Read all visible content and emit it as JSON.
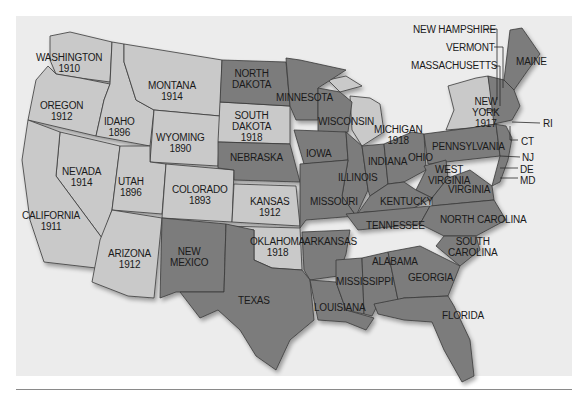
{
  "map": {
    "title": "",
    "colors": {
      "background": "#ececec",
      "suffrage_state": "#c9c9c9",
      "non_suffrage_state": "#7b7b7b",
      "border": "#3a3a3a",
      "text": "#1a1a1a"
    },
    "legend_meaning": "Light gray states show year of full women's suffrage before 1920",
    "states_with_year": [
      {
        "id": "washington",
        "label": "WASHINGTON\n1910",
        "year": 1910,
        "x": 36,
        "y": 52
      },
      {
        "id": "oregon",
        "label": "OREGON\n1912",
        "year": 1912,
        "x": 40,
        "y": 100
      },
      {
        "id": "idaho",
        "label": "IDAHO\n1896",
        "year": 1896,
        "x": 104,
        "y": 116
      },
      {
        "id": "montana",
        "label": "MONTANA\n1914",
        "year": 1914,
        "x": 148,
        "y": 80
      },
      {
        "id": "wyoming",
        "label": "WYOMING\n1890",
        "year": 1890,
        "x": 156,
        "y": 132
      },
      {
        "id": "nevada",
        "label": "NEVADA\n1914",
        "year": 1914,
        "x": 62,
        "y": 166
      },
      {
        "id": "utah",
        "label": "UTAH\n1896",
        "year": 1896,
        "x": 118,
        "y": 176
      },
      {
        "id": "colorado",
        "label": "COLORADO\n1893",
        "year": 1893,
        "x": 172,
        "y": 184
      },
      {
        "id": "california",
        "label": "CALIFORNIA\n1911",
        "year": 1911,
        "x": 22,
        "y": 210
      },
      {
        "id": "arizona",
        "label": "ARIZONA\n1912",
        "year": 1912,
        "x": 108,
        "y": 248
      },
      {
        "id": "south-dakota",
        "label": "SOUTH\nDAKOTA\n1918",
        "year": 1918,
        "x": 232,
        "y": 110
      },
      {
        "id": "kansas",
        "label": "KANSAS\n1912",
        "year": 1912,
        "x": 250,
        "y": 196
      },
      {
        "id": "oklahoma",
        "label": "OKLAHOMA\n1918",
        "year": 1918,
        "x": 250,
        "y": 236
      },
      {
        "id": "michigan",
        "label": "MICHIGAN\n1918",
        "year": 1918,
        "x": 374,
        "y": 124
      },
      {
        "id": "new-york",
        "label": "NEW\nYORK\n1917",
        "year": 1917,
        "x": 472,
        "y": 96
      }
    ],
    "states_without_year": [
      {
        "id": "north-dakota",
        "label": "NORTH\nDAKOTA",
        "x": 232,
        "y": 68
      },
      {
        "id": "minnesota",
        "label": "MINNESOTA",
        "x": 276,
        "y": 92
      },
      {
        "id": "nebraska",
        "label": "NEBRASKA",
        "x": 230,
        "y": 152
      },
      {
        "id": "iowa",
        "label": "IOWA",
        "x": 306,
        "y": 148
      },
      {
        "id": "wisconsin",
        "label": "WISCONSIN",
        "x": 318,
        "y": 116
      },
      {
        "id": "illinois",
        "label": "ILLINOIS",
        "x": 338,
        "y": 172
      },
      {
        "id": "indiana",
        "label": "INDIANA",
        "x": 368,
        "y": 156
      },
      {
        "id": "ohio",
        "label": "OHIO",
        "x": 408,
        "y": 152
      },
      {
        "id": "pennsylvania",
        "label": "PENNSYLVANIA",
        "x": 432,
        "y": 141
      },
      {
        "id": "west-virginia",
        "label": "WEST\nVIRGINIA",
        "x": 428,
        "y": 164
      },
      {
        "id": "virginia",
        "label": "VIRGINIA",
        "x": 448,
        "y": 184
      },
      {
        "id": "missouri",
        "label": "MISSOURI",
        "x": 310,
        "y": 196
      },
      {
        "id": "kentucky",
        "label": "KENTUCKY",
        "x": 380,
        "y": 196
      },
      {
        "id": "tennessee",
        "label": "TENNESSEE",
        "x": 366,
        "y": 220
      },
      {
        "id": "north-carolina",
        "label": "NORTH CAROLINA",
        "x": 440,
        "y": 214
      },
      {
        "id": "south-carolina",
        "label": "SOUTH\nCAROLINA",
        "x": 448,
        "y": 236
      },
      {
        "id": "arkansas",
        "label": "ARKANSAS",
        "x": 304,
        "y": 236
      },
      {
        "id": "new-mexico",
        "label": "NEW\nMEXICO",
        "x": 170,
        "y": 246
      },
      {
        "id": "texas",
        "label": "TEXAS",
        "x": 238,
        "y": 295
      },
      {
        "id": "alabama",
        "label": "ALABAMA",
        "x": 372,
        "y": 256
      },
      {
        "id": "mississippi",
        "label": "MISSISSIPPI",
        "x": 336,
        "y": 276
      },
      {
        "id": "georgia",
        "label": "GEORGIA",
        "x": 408,
        "y": 272
      },
      {
        "id": "louisiana",
        "label": "LOUISIANA",
        "x": 314,
        "y": 302
      },
      {
        "id": "florida",
        "label": "FLORIDA",
        "x": 442,
        "y": 310
      },
      {
        "id": "maine",
        "label": "MAINE",
        "x": 516,
        "y": 56
      }
    ],
    "callouts": [
      {
        "id": "new-hampshire",
        "label": "NEW HAMPSHIRE",
        "x": 413,
        "y": 24
      },
      {
        "id": "vermont",
        "label": "VERMONT",
        "x": 446,
        "y": 42
      },
      {
        "id": "massachusetts",
        "label": "MASSACHUSETTS",
        "x": 411,
        "y": 60
      },
      {
        "id": "ri",
        "label": "RI",
        "x": 543,
        "y": 118
      },
      {
        "id": "ct",
        "label": "CT",
        "x": 521,
        "y": 136
      },
      {
        "id": "nj",
        "label": "NJ",
        "x": 522,
        "y": 152
      },
      {
        "id": "de",
        "label": "DE",
        "x": 520,
        "y": 164
      },
      {
        "id": "md",
        "label": "MD",
        "x": 520,
        "y": 175
      }
    ]
  }
}
